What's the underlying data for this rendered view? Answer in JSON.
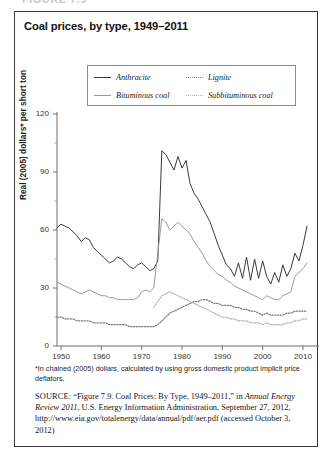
{
  "figure_label": "FIGURE 7.9",
  "title": "Coal prices, by type, 1949–2011",
  "legend": {
    "items": [
      {
        "label": "Anthracite",
        "style": "solid-dark",
        "color": "#3a3a3a"
      },
      {
        "label": "Lignite",
        "style": "dot-dark",
        "color": "#7d7d7d"
      },
      {
        "label": "Bituminous coal",
        "style": "solid-gray",
        "color": "#9a9a9a"
      },
      {
        "label": "Subbituminous coal",
        "style": "dot-light",
        "color": "#b4b4b4"
      }
    ]
  },
  "footnote": "*In chained (2005) dollars, calculated by using gross domestic product implicit price deflators.",
  "source": {
    "label": "SOURCE:",
    "text_1": " “Figure 7.9. Coal Prices: By Type, 1949–2011,” in ",
    "italic_1": "Annual Energy Review 2011",
    "text_2": ", U.S. Energy Information Administration, September 27, 2012, http://www.eia.gov/totalenergy/data/annual/pdf/aer.pdf (accessed October 3, 2012)"
  },
  "chart_data": {
    "type": "line",
    "title": "Coal prices, by type, 1949–2011",
    "xlabel": "",
    "ylabel": "Real (2005) dollars* per short ton",
    "xlim": [
      1949,
      2011
    ],
    "ylim": [
      0,
      120
    ],
    "yticks": [
      0,
      30,
      60,
      90,
      120
    ],
    "xticks": [
      1950,
      1960,
      1970,
      1980,
      1990,
      2000,
      2010
    ],
    "grid": false,
    "legend_position": "above-plot",
    "x": [
      1949,
      1950,
      1951,
      1952,
      1953,
      1954,
      1955,
      1956,
      1957,
      1958,
      1959,
      1960,
      1961,
      1962,
      1963,
      1964,
      1965,
      1966,
      1967,
      1968,
      1969,
      1970,
      1971,
      1972,
      1973,
      1974,
      1975,
      1976,
      1977,
      1978,
      1979,
      1980,
      1981,
      1982,
      1983,
      1984,
      1985,
      1986,
      1987,
      1988,
      1989,
      1990,
      1991,
      1992,
      1993,
      1994,
      1995,
      1996,
      1997,
      1998,
      1999,
      2000,
      2001,
      2002,
      2003,
      2004,
      2005,
      2006,
      2007,
      2008,
      2009,
      2010,
      2011
    ],
    "series": [
      {
        "name": "Anthracite",
        "style": "solid",
        "color": "#3a3a3a",
        "values": [
          61,
          63,
          62,
          61,
          59,
          57,
          54,
          56,
          55,
          51,
          49,
          47,
          45,
          43,
          44,
          46,
          45,
          43,
          41,
          40,
          42,
          43,
          41,
          39,
          40,
          44,
          101,
          99,
          95,
          91,
          98,
          92,
          96,
          84,
          79,
          76,
          72,
          68,
          64,
          58,
          52,
          47,
          42,
          40,
          36,
          43,
          35,
          46,
          34,
          45,
          35,
          44,
          36,
          32,
          38,
          33,
          42,
          36,
          40,
          48,
          44,
          52,
          62
        ]
      },
      {
        "name": "Bituminous coal",
        "style": "solid",
        "color": "#9a9a9a",
        "values": [
          33,
          32,
          31,
          30,
          29,
          28,
          27,
          28,
          29,
          28,
          27,
          26,
          26,
          25,
          25,
          24,
          24,
          24,
          24,
          24,
          25,
          28,
          29,
          28,
          30,
          48,
          66,
          64,
          60,
          62,
          64,
          62,
          60,
          58,
          54,
          51,
          48,
          44,
          41,
          39,
          37,
          36,
          34,
          33,
          31,
          30,
          29,
          28,
          27,
          26,
          25,
          24,
          26,
          25,
          24,
          24,
          26,
          27,
          28,
          36,
          38,
          40,
          43
        ]
      },
      {
        "name": "Lignite",
        "style": "dotted",
        "color": "#7d7d7d",
        "values": [
          15,
          15,
          14,
          14,
          14,
          13,
          13,
          13,
          13,
          12,
          12,
          12,
          12,
          11,
          11,
          11,
          11,
          11,
          10,
          10,
          10,
          10,
          10,
          10,
          10,
          11,
          13,
          15,
          17,
          18,
          19,
          20,
          21,
          22,
          23,
          23,
          24,
          24,
          23,
          22,
          22,
          21,
          21,
          21,
          20,
          20,
          19,
          19,
          18,
          18,
          17,
          16,
          17,
          16,
          16,
          16,
          16,
          17,
          17,
          18,
          18,
          18,
          18
        ]
      },
      {
        "name": "Subbituminous coal",
        "style": "dotted",
        "color": "#b4b4b4",
        "values": [
          null,
          null,
          null,
          null,
          null,
          null,
          null,
          null,
          null,
          null,
          null,
          null,
          null,
          null,
          null,
          null,
          null,
          null,
          null,
          null,
          null,
          null,
          null,
          null,
          20,
          23,
          26,
          27,
          28,
          27,
          26,
          25,
          24,
          23,
          22,
          21,
          20,
          19,
          18,
          17,
          16,
          15,
          15,
          14,
          14,
          13,
          13,
          13,
          12,
          12,
          12,
          11,
          12,
          11,
          11,
          11,
          11,
          12,
          12,
          13,
          13,
          14,
          14
        ]
      }
    ]
  }
}
